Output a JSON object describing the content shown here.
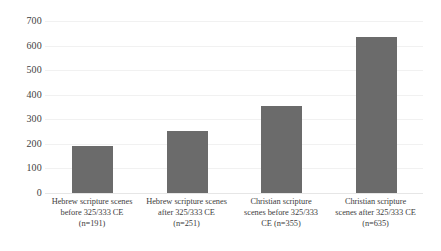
{
  "chart_data": {
    "type": "bar",
    "title": "",
    "subtitle": "",
    "xlabel": "",
    "ylabel": "",
    "ylim": [
      0,
      700
    ],
    "y_ticks": [
      0,
      100,
      200,
      300,
      400,
      500,
      600,
      700
    ],
    "grid": true,
    "legend": false,
    "legend_position": "none",
    "bar_color": "#6b6b6b",
    "gridline_color": "#f1f1f1",
    "background_color": "#ffffff",
    "categories": [
      "Hebrew scripture scenes before 325/333 CE (n=191)",
      "Hebrew scripture scenes after 325/333 CE (n=251)",
      "Christian scripture scenes before 325/333 CE (n=355)",
      "Christian scripture scenes after 325/333 CE (n=635)"
    ],
    "category_lines": [
      [
        "Hebrew scripture scenes",
        "before 325/333 CE",
        "(n=191)"
      ],
      [
        "Hebrew scripture scenes",
        "after 325/333 CE",
        "(n=251)"
      ],
      [
        "Christian scripture",
        "scenes before 325/333",
        "CE (n=355)"
      ],
      [
        "Christian scripture",
        "scenes after 325/333 CE",
        "(n=635)"
      ]
    ],
    "values": [
      191,
      251,
      355,
      635
    ]
  },
  "axis": {
    "y_tick_labels": [
      "700",
      "600",
      "500",
      "400",
      "300",
      "200",
      "100",
      "0"
    ]
  }
}
